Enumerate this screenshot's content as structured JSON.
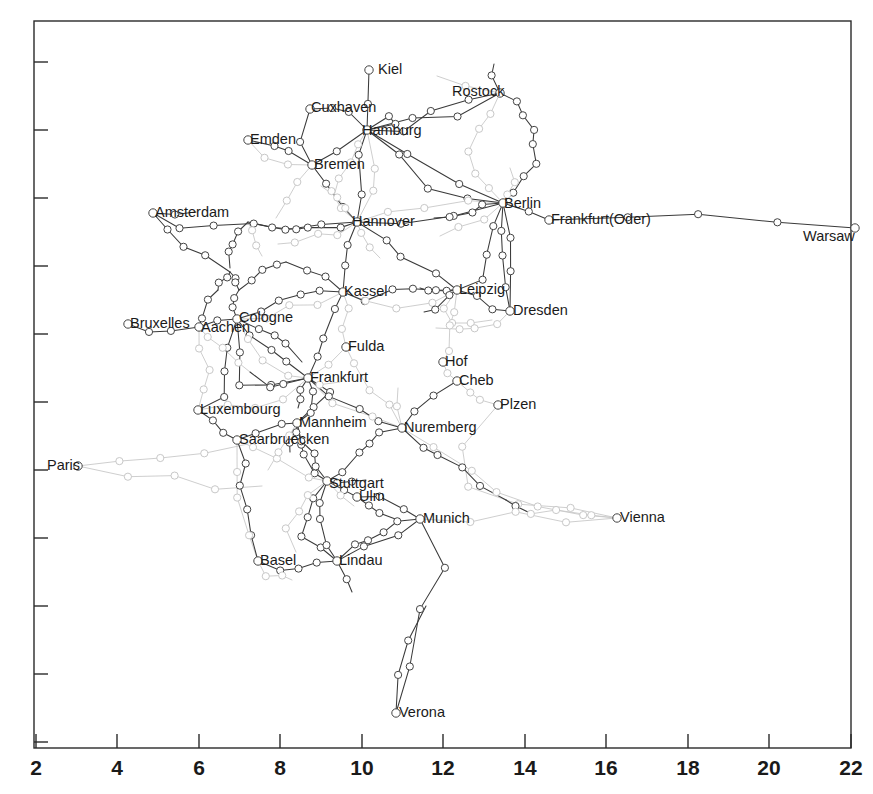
{
  "figure": {
    "type": "network-graph"
  },
  "chart_data": {
    "type": "scatter",
    "title": "",
    "xlabel": "",
    "ylabel": "",
    "xlim": [
      2,
      22
    ],
    "ylim": [
      0,
      1
    ],
    "grid": false,
    "legend": "none",
    "xticks": [
      "2",
      "4",
      "6",
      "8",
      "10",
      "12",
      "14",
      "16",
      "18",
      "20",
      "22"
    ],
    "yticks": [],
    "colors": {
      "frame": "#2a2a2a",
      "edge_dark": "#3a3a3a",
      "edge_light": "#c8c8c8",
      "node_stroke": "#444444",
      "label": "#1b1b1b"
    },
    "labeled_cities": [
      {
        "name": "Kiel",
        "x": 369,
        "y": 70,
        "lx": 378,
        "ly": 70
      },
      {
        "name": "Cuxhaven",
        "x": 310,
        "y": 109,
        "lx": 311,
        "ly": 108
      },
      {
        "name": "Rostock",
        "x": 500,
        "y": 93,
        "lx": 452,
        "ly": 92
      },
      {
        "name": "Hamburg",
        "x": 367,
        "y": 130,
        "lx": 362,
        "ly": 131
      },
      {
        "name": "Emden",
        "x": 248,
        "y": 140,
        "lx": 250,
        "ly": 140
      },
      {
        "name": "Bremen",
        "x": 312,
        "y": 165,
        "lx": 314,
        "ly": 165
      },
      {
        "name": "Amsterdam",
        "x": 153,
        "y": 213,
        "lx": 155,
        "ly": 213
      },
      {
        "name": "Hannover",
        "x": 357,
        "y": 222,
        "lx": 352,
        "ly": 222
      },
      {
        "name": "Berlin",
        "x": 503,
        "y": 203,
        "lx": 504,
        "ly": 204
      },
      {
        "name": "Frankfurt(Oder)",
        "x": 549,
        "y": 220,
        "lx": 551,
        "ly": 220
      },
      {
        "name": "Warsaw",
        "x": 855,
        "y": 228,
        "lx": 803,
        "ly": 237
      },
      {
        "name": "Kassel",
        "x": 343,
        "y": 292,
        "lx": 344,
        "ly": 292
      },
      {
        "name": "Leipzig",
        "x": 457,
        "y": 290,
        "lx": 459,
        "ly": 290
      },
      {
        "name": "Dresden",
        "x": 510,
        "y": 311,
        "lx": 513,
        "ly": 311
      },
      {
        "name": "Bruxelles",
        "x": 128,
        "y": 324,
        "lx": 130,
        "ly": 324
      },
      {
        "name": "Aachen",
        "x": 199,
        "y": 327,
        "lx": 201,
        "ly": 328
      },
      {
        "name": "Cologne",
        "x": 237,
        "y": 319,
        "lx": 239,
        "ly": 318
      },
      {
        "name": "Fulda",
        "x": 346,
        "y": 347,
        "lx": 348,
        "ly": 347
      },
      {
        "name": "Hof",
        "x": 443,
        "y": 362,
        "lx": 445,
        "ly": 362
      },
      {
        "name": "Cheb",
        "x": 457,
        "y": 381,
        "lx": 459,
        "ly": 381
      },
      {
        "name": "Frankfurt",
        "x": 308,
        "y": 378,
        "lx": 310,
        "ly": 378
      },
      {
        "name": "Plzen",
        "x": 498,
        "y": 405,
        "lx": 500,
        "ly": 405
      },
      {
        "name": "Luxembourg",
        "x": 198,
        "y": 410,
        "lx": 200,
        "ly": 410
      },
      {
        "name": "Mannheim",
        "x": 297,
        "y": 423,
        "lx": 299,
        "ly": 423
      },
      {
        "name": "Nuremberg",
        "x": 402,
        "y": 428,
        "lx": 404,
        "ly": 428
      },
      {
        "name": "Saarbruecken",
        "x": 237,
        "y": 440,
        "lx": 239,
        "ly": 440
      },
      {
        "name": "Paris",
        "x": 78,
        "y": 466,
        "lx": 47,
        "ly": 466
      },
      {
        "name": "Stuttgart",
        "x": 327,
        "y": 481,
        "lx": 329,
        "ly": 484
      },
      {
        "name": "Ulm",
        "x": 357,
        "y": 497,
        "lx": 359,
        "ly": 497
      },
      {
        "name": "Munich",
        "x": 420,
        "y": 519,
        "lx": 423,
        "ly": 519
      },
      {
        "name": "Vienna",
        "x": 617,
        "y": 518,
        "lx": 620,
        "ly": 518
      },
      {
        "name": "Basel",
        "x": 258,
        "y": 561,
        "lx": 260,
        "ly": 561
      },
      {
        "name": "Lindau",
        "x": 337,
        "y": 561,
        "lx": 339,
        "ly": 561
      },
      {
        "name": "Verona",
        "x": 396,
        "y": 713,
        "lx": 399,
        "ly": 713
      }
    ]
  },
  "axis": {
    "ticks": [
      {
        "label": "2",
        "x": 36
      },
      {
        "label": "4",
        "x": 117
      },
      {
        "label": "6",
        "x": 199
      },
      {
        "label": "8",
        "x": 280
      },
      {
        "label": "10",
        "x": 362
      },
      {
        "label": "12",
        "x": 443
      },
      {
        "label": "14",
        "x": 525
      },
      {
        "label": "16",
        "x": 606
      },
      {
        "label": "18",
        "x": 688
      },
      {
        "label": "20",
        "x": 769
      },
      {
        "label": "22",
        "x": 851
      }
    ],
    "yticks_y": [
      62,
      130,
      198,
      266,
      334,
      402,
      470,
      538,
      606,
      674,
      742
    ]
  }
}
